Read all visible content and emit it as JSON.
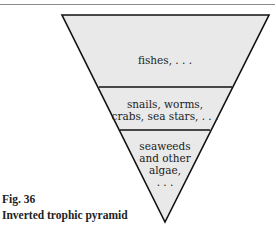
{
  "figure": {
    "number": "Fig. 36",
    "title": "Inverted trophic pyramid"
  },
  "pyramid": {
    "orientation": "inverted",
    "levels": [
      {
        "label": "fishes, . . ."
      },
      {
        "label_line1": "snails, worms,",
        "label_line2": "crabs, sea stars, . . ."
      },
      {
        "label_line1": "seaweeds",
        "label_line2": "and other",
        "label_line3": "algae,",
        "label_line4": ". . ."
      }
    ],
    "fill_color": "#e8e8e8",
    "stroke_color": "#111111"
  }
}
